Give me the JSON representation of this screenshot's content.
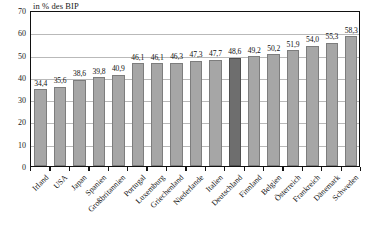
{
  "chart_data": {
    "type": "bar",
    "title": "in % des BIP",
    "xlabel": "",
    "ylabel": "",
    "ylim": [
      0,
      70
    ],
    "yticks": [
      0,
      10,
      20,
      30,
      40,
      50,
      60,
      70
    ],
    "grid": true,
    "legend": null,
    "decimal_separator": ",",
    "categories": [
      "Irland",
      "USA",
      "Japan",
      "Spanien",
      "Großbritannien",
      "Portugal",
      "Luxemburg",
      "Griechenland",
      "Niederlande",
      "Italien",
      "Deutschland",
      "Finnland",
      "Belgien",
      "Österreich",
      "Frankreich",
      "Dänemark",
      "Schweden"
    ],
    "values": [
      34.4,
      35.6,
      38.6,
      39.8,
      40.9,
      46.1,
      46.1,
      46.3,
      47.3,
      47.7,
      48.6,
      49.2,
      50.2,
      51.9,
      54.0,
      55.3,
      58.3
    ],
    "value_labels": [
      "34,4",
      "35,6",
      "38,6",
      "39,8",
      "40,9",
      "46,1",
      "46,1",
      "46,3",
      "47,3",
      "47,7",
      "48,6",
      "49,2",
      "50,2",
      "51,9",
      "54,0",
      "55,3",
      "58,3"
    ],
    "highlight_index": 10,
    "colors": {
      "bar": "#a6a6a6",
      "bar_highlight": "#6e6e6e",
      "bar_border": "#7d7d7d",
      "grid": "#b9b9b9",
      "frame": "#111111",
      "text": "#141414"
    }
  }
}
